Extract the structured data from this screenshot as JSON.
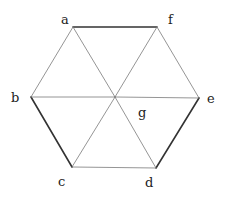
{
  "diagram": {
    "type": "graph",
    "colors": {
      "background": "#ffffff",
      "thin_edge": "#7a7a7a",
      "thick_edge": "#333333",
      "label": "#222222"
    },
    "nodes": [
      {
        "id": "a",
        "label": "a",
        "x": 73,
        "y": 27,
        "lx": 61,
        "ly": 24
      },
      {
        "id": "f",
        "label": "f",
        "x": 157,
        "y": 27,
        "lx": 168,
        "ly": 24
      },
      {
        "id": "b",
        "label": "b",
        "x": 31,
        "y": 97,
        "lx": 11,
        "ly": 102
      },
      {
        "id": "e",
        "label": "e",
        "x": 199,
        "y": 98,
        "lx": 207,
        "ly": 103
      },
      {
        "id": "c",
        "label": "c",
        "x": 72,
        "y": 167,
        "lx": 58,
        "ly": 186
      },
      {
        "id": "d",
        "label": "d",
        "x": 156,
        "y": 168,
        "lx": 145,
        "ly": 187
      },
      {
        "id": "g",
        "label": "g",
        "x": 115,
        "y": 97,
        "lx": 138,
        "ly": 117
      }
    ],
    "edges": [
      {
        "from": "a",
        "to": "f",
        "weight": "thick"
      },
      {
        "from": "f",
        "to": "e",
        "weight": "thin"
      },
      {
        "from": "e",
        "to": "d",
        "weight": "thick"
      },
      {
        "from": "d",
        "to": "c",
        "weight": "thin"
      },
      {
        "from": "c",
        "to": "b",
        "weight": "thick"
      },
      {
        "from": "b",
        "to": "a",
        "weight": "thin"
      },
      {
        "from": "a",
        "to": "g",
        "weight": "thin"
      },
      {
        "from": "b",
        "to": "g",
        "weight": "thin"
      },
      {
        "from": "c",
        "to": "g",
        "weight": "thin"
      },
      {
        "from": "d",
        "to": "g",
        "weight": "thin"
      },
      {
        "from": "e",
        "to": "g",
        "weight": "thin"
      },
      {
        "from": "f",
        "to": "g",
        "weight": "thin"
      }
    ]
  }
}
